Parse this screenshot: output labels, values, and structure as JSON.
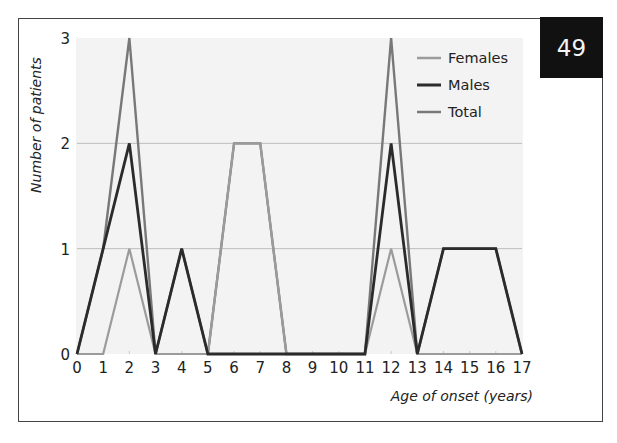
{
  "badge": {
    "text": "49"
  },
  "chart_data": {
    "type": "line",
    "title": "",
    "xlabel": "Age of onset (years)",
    "ylabel": "Number of patients",
    "x": [
      0,
      1,
      2,
      3,
      4,
      5,
      6,
      7,
      8,
      9,
      10,
      11,
      12,
      13,
      14,
      15,
      16,
      17
    ],
    "x_tick_labels": [
      "0",
      "1",
      "2",
      "3",
      "4",
      "5",
      "6",
      "7",
      "8",
      "9",
      "10",
      "11",
      "12",
      "13",
      "14",
      "15",
      "16",
      "17"
    ],
    "y_tick_labels": [
      "0",
      "1",
      "2",
      "3"
    ],
    "xlim": [
      0,
      17
    ],
    "ylim": [
      0,
      3
    ],
    "grid": "horizontal",
    "legend_position": "top-right",
    "series": [
      {
        "name": "Females",
        "color": "#9b9b9b",
        "values": [
          0,
          0,
          1,
          0,
          0,
          0,
          2,
          2,
          0,
          0,
          0,
          0,
          1,
          0,
          0,
          0,
          0,
          0
        ]
      },
      {
        "name": "Males",
        "color": "#2b2b2b",
        "values": [
          0,
          1,
          2,
          0,
          1,
          0,
          0,
          0,
          0,
          0,
          0,
          0,
          2,
          0,
          1,
          1,
          1,
          0
        ]
      },
      {
        "name": "Total",
        "color": "#787878",
        "values": [
          0,
          1,
          3,
          0,
          1,
          0,
          2,
          2,
          0,
          0,
          0,
          0,
          3,
          0,
          1,
          1,
          1,
          0
        ]
      }
    ]
  }
}
